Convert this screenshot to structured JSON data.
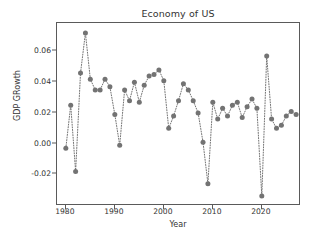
{
  "chart_data": {
    "type": "line",
    "title": "Economy of US",
    "xlabel": "Year",
    "ylabel": "GDP GRowth",
    "grid": false,
    "legend": null,
    "marker": "circle",
    "linestyle": "dotted",
    "color": "#737373",
    "xlim": [
      1978.2,
      2028.0
    ],
    "ylim": [
      -0.0405,
      0.0785
    ],
    "xticks": [
      1980,
      1990,
      2000,
      2010,
      2020
    ],
    "xtick_labels": [
      "1980",
      "1990",
      "2000",
      "2010",
      "2020"
    ],
    "yticks": [
      -0.02,
      0.0,
      0.02,
      0.04,
      0.06
    ],
    "ytick_labels": [
      "-0.02",
      "0.00",
      "0.02",
      "0.04",
      "0.06"
    ],
    "x": [
      1980,
      1981,
      1982,
      1983,
      1984,
      1985,
      1986,
      1987,
      1988,
      1989,
      1990,
      1991,
      1992,
      1993,
      1994,
      1995,
      1996,
      1997,
      1998,
      1999,
      2000,
      2001,
      2002,
      2003,
      2004,
      2005,
      2006,
      2007,
      2008,
      2009,
      2010,
      2011,
      2012,
      2013,
      2014,
      2015,
      2016,
      2017,
      2018,
      2019,
      2020,
      2021,
      2022,
      2023,
      2024,
      2025,
      2026,
      2027
    ],
    "y": [
      -0.003,
      0.025,
      -0.018,
      0.046,
      0.072,
      0.042,
      0.035,
      0.035,
      0.042,
      0.037,
      0.019,
      -0.001,
      0.035,
      0.028,
      0.04,
      0.027,
      0.038,
      0.044,
      0.045,
      0.048,
      0.041,
      0.01,
      0.018,
      0.028,
      0.039,
      0.035,
      0.028,
      0.02,
      0.001,
      -0.026,
      0.027,
      0.016,
      0.023,
      0.018,
      0.025,
      0.027,
      0.017,
      0.024,
      0.029,
      0.023,
      -0.034,
      0.057,
      0.016,
      0.01,
      0.012,
      0.018,
      0.021,
      0.019
    ]
  }
}
